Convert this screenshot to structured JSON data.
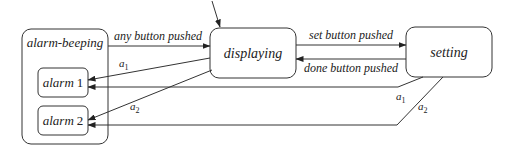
{
  "diagram": {
    "type": "state-machine",
    "states": {
      "alarm_beeping": {
        "label": "alarm-beeping"
      },
      "alarm1": {
        "label_word": "alarm",
        "label_num": "1"
      },
      "alarm2": {
        "label_word": "alarm",
        "label_num": "2"
      },
      "displaying": {
        "label": "displaying"
      },
      "setting": {
        "label": "setting"
      }
    },
    "transitions": {
      "any_button": {
        "label": "any button pushed",
        "from": "alarm-beeping",
        "to": "displaying"
      },
      "set_button": {
        "label": "set button pushed",
        "from": "displaying",
        "to": "setting"
      },
      "done_button": {
        "label": "done button pushed",
        "from": "setting",
        "to": "displaying"
      },
      "disp_a1": {
        "label_base": "a",
        "label_sub": "1",
        "from": "displaying",
        "to": "alarm 1"
      },
      "disp_a2": {
        "label_base": "a",
        "label_sub": "2",
        "from": "displaying",
        "to": "alarm 2"
      },
      "set_a1": {
        "label_base": "a",
        "label_sub": "1",
        "from": "setting",
        "to": "alarm 1"
      },
      "set_a2": {
        "label_base": "a",
        "label_sub": "2",
        "from": "setting",
        "to": "alarm 2"
      },
      "initial": {
        "to": "displaying"
      }
    }
  }
}
